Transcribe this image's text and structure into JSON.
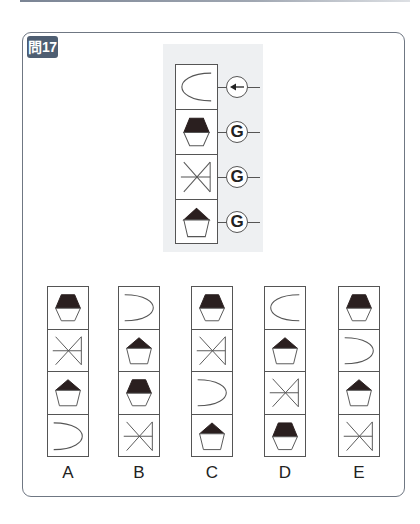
{
  "header": {
    "badge": "問17"
  },
  "question": {
    "rows": [
      {
        "shape": "arc-open-right",
        "operator": "arrow-left-icon",
        "operator_text": ""
      },
      {
        "shape": "hexagon-half-filled",
        "operator": "G",
        "operator_text": "G"
      },
      {
        "shape": "x-bar",
        "operator": "G",
        "operator_text": "G"
      },
      {
        "shape": "pentagon-top-filled",
        "operator": "G",
        "operator_text": "G"
      }
    ]
  },
  "options": [
    {
      "label": "A",
      "cells": [
        "hexagon-half-filled",
        "x-bar",
        "pentagon-top-filled",
        "arc-open-left"
      ]
    },
    {
      "label": "B",
      "cells": [
        "arc-open-left",
        "pentagon-top-filled",
        "hexagon-half-filled",
        "x-bar"
      ]
    },
    {
      "label": "C",
      "cells": [
        "hexagon-half-filled",
        "x-bar",
        "arc-open-left",
        "pentagon-top-filled"
      ]
    },
    {
      "label": "D",
      "cells": [
        "arc-open-right",
        "pentagon-top-filled",
        "x-bar",
        "hexagon-half-filled"
      ]
    },
    {
      "label": "E",
      "cells": [
        "hexagon-half-filled",
        "arc-open-left",
        "pentagon-top-filled",
        "x-bar"
      ]
    }
  ],
  "colors": {
    "badge_bg": "#4e5e72",
    "panel_bg": "#eef0f2",
    "stroke": "#555555",
    "fill": "#2a1f1f"
  }
}
